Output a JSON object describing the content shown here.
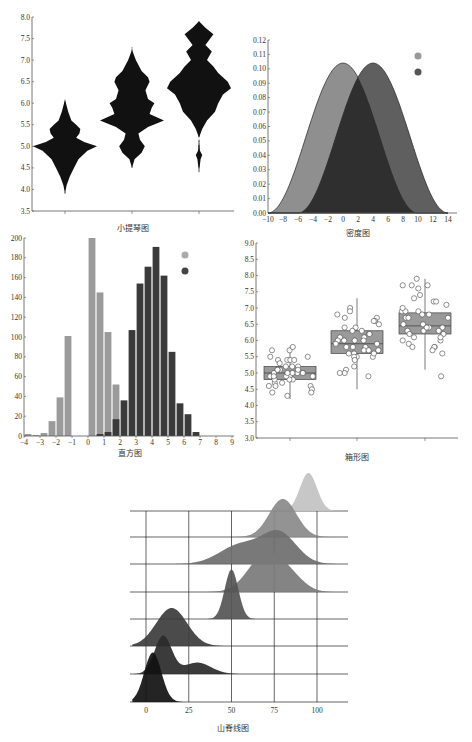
{
  "chart_data": [
    {
      "id": "violin",
      "type": "violin",
      "title": "小提琴图",
      "xlabel": "",
      "ylabel": "",
      "ylim": [
        3.5,
        8.0
      ],
      "yticks": [
        "3.5",
        "4.0",
        "4.5",
        "5.0",
        "5.5",
        "6.0",
        "6.5",
        "7.0",
        "7.5",
        "8.0"
      ],
      "categories": [
        "",
        "",
        ""
      ],
      "fill": "#111111",
      "series": [
        {
          "name": "group1",
          "min": 3.9,
          "max": 6.1,
          "profile": [
            [
              3.9,
              0.0
            ],
            [
              4.1,
              0.05
            ],
            [
              4.3,
              0.15
            ],
            [
              4.5,
              0.28
            ],
            [
              4.7,
              0.42
            ],
            [
              4.9,
              0.7
            ],
            [
              5.0,
              1.0
            ],
            [
              5.1,
              0.6
            ],
            [
              5.2,
              0.35
            ],
            [
              5.3,
              0.45
            ],
            [
              5.4,
              0.48
            ],
            [
              5.5,
              0.35
            ],
            [
              5.6,
              0.2
            ],
            [
              5.8,
              0.1
            ],
            [
              6.0,
              0.03
            ],
            [
              6.1,
              0.0
            ]
          ]
        },
        {
          "name": "group2",
          "min": 4.5,
          "max": 7.3,
          "profile": [
            [
              4.5,
              0.0
            ],
            [
              4.7,
              0.08
            ],
            [
              4.85,
              0.3
            ],
            [
              5.0,
              0.4
            ],
            [
              5.15,
              0.25
            ],
            [
              5.3,
              0.2
            ],
            [
              5.45,
              0.5
            ],
            [
              5.6,
              1.0
            ],
            [
              5.75,
              0.55
            ],
            [
              5.9,
              0.62
            ],
            [
              6.0,
              0.7
            ],
            [
              6.1,
              0.5
            ],
            [
              6.3,
              0.42
            ],
            [
              6.5,
              0.55
            ],
            [
              6.6,
              0.5
            ],
            [
              6.75,
              0.3
            ],
            [
              7.0,
              0.12
            ],
            [
              7.2,
              0.02
            ],
            [
              7.3,
              0.0
            ]
          ]
        },
        {
          "name": "group3",
          "min": 4.4,
          "max": 7.9,
          "profile": [
            [
              4.4,
              0.0
            ],
            [
              4.7,
              0.05
            ],
            [
              4.8,
              0.1
            ],
            [
              4.9,
              0.03
            ],
            [
              5.2,
              0.0
            ],
            [
              5.4,
              0.1
            ],
            [
              5.6,
              0.25
            ],
            [
              5.8,
              0.5
            ],
            [
              6.0,
              0.6
            ],
            [
              6.2,
              0.75
            ],
            [
              6.35,
              1.0
            ],
            [
              6.5,
              0.9
            ],
            [
              6.7,
              0.6
            ],
            [
              6.85,
              0.45
            ],
            [
              7.0,
              0.25
            ],
            [
              7.2,
              0.4
            ],
            [
              7.35,
              0.2
            ],
            [
              7.45,
              0.3
            ],
            [
              7.6,
              0.45
            ],
            [
              7.75,
              0.2
            ],
            [
              7.9,
              0.0
            ]
          ]
        }
      ]
    },
    {
      "id": "density",
      "type": "area",
      "title": "密度图",
      "xlim": [
        -10,
        14
      ],
      "ylim": [
        0,
        0.12
      ],
      "xticks": [
        "-10",
        "-8",
        "-6",
        "-4",
        "-2",
        "0",
        "2",
        "4",
        "6",
        "8",
        "10",
        "12",
        "14"
      ],
      "yticks": [
        "0.00",
        "0.01",
        "0.02",
        "0.03",
        "0.04",
        "0.05",
        "0.06",
        "0.07",
        "0.08",
        "0.09",
        "0.10",
        "0.11",
        "0.12"
      ],
      "series": [
        {
          "name": "series-a",
          "mean": 0,
          "peak": 0.104,
          "halfwidth": 10,
          "color": "#8f8f8f"
        },
        {
          "name": "series-b",
          "mean": 4,
          "peak": 0.104,
          "halfwidth": 10,
          "color": "#5f5f5f"
        }
      ],
      "overlap_color": "#2f2f2f",
      "legend": [
        {
          "color": "#999999"
        },
        {
          "color": "#555555"
        }
      ]
    },
    {
      "id": "histogram",
      "type": "bar",
      "title": "直方图",
      "xlim": [
        -4,
        9
      ],
      "ylim": [
        0,
        200
      ],
      "xticks": [
        "-4",
        "-3",
        "-2",
        "-1",
        "0",
        "1",
        "2",
        "3",
        "4",
        "5",
        "6",
        "7",
        "8",
        "9"
      ],
      "yticks": [
        "0",
        "20",
        "40",
        "60",
        "80",
        "100",
        "120",
        "140",
        "160",
        "180",
        "200"
      ],
      "bin_width": 0.5,
      "series": [
        {
          "name": "series-a",
          "color": "#9a9a9a",
          "bins": [
            [
              -4,
              2
            ],
            [
              -3.5,
              1
            ],
            [
              -3,
              3
            ],
            [
              -2.5,
              15
            ],
            [
              -2,
              39
            ],
            [
              -1.5,
              101
            ],
            [
              -1,
              0
            ],
            [
              -0.5,
              0
            ],
            [
              0,
              200
            ],
            [
              0.5,
              145
            ],
            [
              1,
              105
            ],
            [
              1.5,
              52
            ],
            [
              2,
              0
            ],
            [
              2.5,
              0
            ]
          ]
        },
        {
          "name": "series-b",
          "color": "#3a3a3a",
          "bins": [
            [
              0.5,
              2
            ],
            [
              1,
              4
            ],
            [
              1.5,
              17
            ],
            [
              2,
              36
            ],
            [
              2.5,
              107
            ],
            [
              3,
              154
            ],
            [
              3.5,
              171
            ],
            [
              4,
              191
            ],
            [
              4.5,
              162
            ],
            [
              5,
              85
            ],
            [
              5.5,
              33
            ],
            [
              6,
              22
            ],
            [
              6.5,
              4
            ]
          ]
        }
      ],
      "legend": [
        {
          "color": "#aaaaaa"
        },
        {
          "color": "#444444"
        }
      ]
    },
    {
      "id": "boxplot",
      "type": "box",
      "title": "箱形图",
      "ylim": [
        3.0,
        9.0
      ],
      "yticks": [
        "3.0",
        "3.5",
        "4.0",
        "4.5",
        "5.0",
        "5.5",
        "6.0",
        "6.5",
        "7.0",
        "7.5",
        "8.0",
        "8.5",
        "9.0"
      ],
      "box_color": "#9a9a9a",
      "series": [
        {
          "name": "group1",
          "q1": 4.8,
          "median": 5.0,
          "q3": 5.2,
          "whisker_low": 4.2,
          "whisker_high": 5.8,
          "points": [
            5.7,
            5.8,
            5.7,
            5.4,
            5.4,
            5.4,
            5.5,
            5.5,
            5.4,
            5.2,
            5.1,
            5.0,
            5.0,
            4.9,
            4.9,
            5.1,
            5.2,
            5.0,
            4.8,
            4.8,
            4.7,
            4.6,
            4.6,
            4.5,
            4.4,
            4.3,
            4.4,
            4.6,
            4.9,
            5.0,
            5.1,
            5.3,
            4.8,
            4.9,
            5.0,
            5.1,
            5.2,
            4.7,
            4.9,
            5.0
          ]
        },
        {
          "name": "group2",
          "q1": 5.6,
          "median": 5.9,
          "q3": 6.3,
          "whisker_low": 4.5,
          "whisker_high": 7.3,
          "points": [
            7.0,
            6.9,
            6.8,
            6.7,
            6.7,
            6.6,
            6.4,
            6.4,
            6.3,
            6.3,
            6.2,
            6.1,
            6.1,
            6.0,
            6.0,
            6.0,
            5.9,
            5.8,
            5.8,
            5.7,
            5.7,
            5.6,
            5.6,
            5.5,
            5.5,
            5.5,
            5.4,
            5.2,
            5.1,
            5.0,
            4.9,
            5.0,
            5.8,
            6.2,
            6.6,
            6.5,
            5.9,
            5.6,
            5.7,
            6.0
          ]
        },
        {
          "name": "group3",
          "q1": 6.2,
          "median": 6.45,
          "q3": 6.85,
          "whisker_low": 5.1,
          "whisker_high": 7.9,
          "points": [
            7.7,
            7.7,
            7.9,
            7.6,
            7.7,
            7.4,
            7.2,
            7.2,
            7.3,
            7.1,
            6.9,
            6.9,
            6.8,
            6.8,
            6.7,
            6.7,
            6.5,
            6.4,
            6.4,
            6.3,
            6.3,
            6.3,
            6.2,
            6.1,
            6.0,
            5.9,
            5.8,
            5.8,
            5.7,
            5.6,
            5.8,
            6.0,
            6.2,
            6.5,
            6.9,
            7.0,
            6.4,
            6.1,
            4.9,
            6.7
          ]
        }
      ]
    },
    {
      "id": "ridgeline",
      "type": "ridgeline",
      "title": "山脊线图",
      "xlim": [
        -8,
        112
      ],
      "xticks": [
        "0",
        "25",
        "50",
        "75",
        "100"
      ],
      "series": [
        {
          "name": "ridge-1",
          "color": "#c2c2c2",
          "peaks": [
            [
              95,
              1.0,
              5
            ],
            [
              65,
              0.02,
              8
            ]
          ]
        },
        {
          "name": "ridge-2",
          "color": "#8a8a8a",
          "peaks": [
            [
              80,
              1.0,
              8
            ]
          ]
        },
        {
          "name": "ridge-3",
          "color": "#6e6e6e",
          "peaks": [
            [
              78,
              0.8,
              10
            ],
            [
              55,
              0.5,
              12
            ]
          ]
        },
        {
          "name": "ridge-4",
          "color": "#7a7a7a",
          "peaks": [
            [
              70,
              1.0,
              10
            ],
            [
              85,
              0.3,
              8
            ]
          ]
        },
        {
          "name": "ridge-5",
          "color": "#555555",
          "peaks": [
            [
              50,
              1.3,
              4
            ]
          ]
        },
        {
          "name": "ridge-6",
          "color": "#3c3c3c",
          "peaks": [
            [
              15,
              1.0,
              9
            ]
          ]
        },
        {
          "name": "ridge-7",
          "color": "#2a2a2a",
          "peaks": [
            [
              10,
              1.0,
              5
            ],
            [
              30,
              0.3,
              8
            ]
          ]
        },
        {
          "name": "ridge-8",
          "color": "#111111",
          "peaks": [
            [
              4,
              1.3,
              5
            ]
          ]
        }
      ]
    }
  ]
}
